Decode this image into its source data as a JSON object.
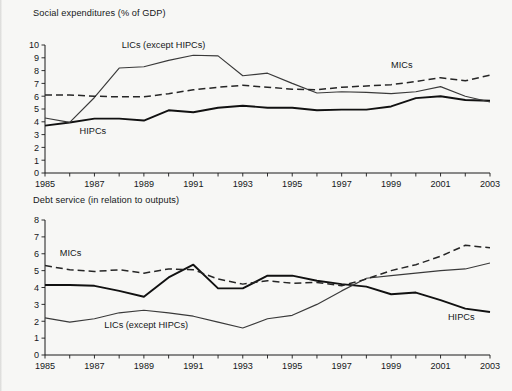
{
  "page": {
    "background_color": "#f7f7f5",
    "ink_color": "#16181a"
  },
  "figures": [
    {
      "id": "social",
      "title": "Social expenditures (% of GDP)"
    },
    {
      "id": "debt",
      "title": "Debt service (in relation to outputs)"
    }
  ],
  "chart_data": [
    {
      "type": "line",
      "title": "Social expenditures (% of GDP)",
      "xlabel": "",
      "ylabel": "",
      "grid": false,
      "legend": "inline-annotations",
      "xlim": [
        1985,
        2003
      ],
      "ylim": [
        0,
        10
      ],
      "ytick_labels": [
        "0",
        "1",
        "2",
        "3",
        "4",
        "5",
        "6",
        "7",
        "8",
        "9",
        "10"
      ],
      "xtick_labels": [
        "1985",
        "1987",
        "1989",
        "1991",
        "1993",
        "1995",
        "1997",
        "1999",
        "2001",
        "2003"
      ],
      "xticks_minor_every": 1,
      "x": [
        1985,
        1986,
        1987,
        1988,
        1989,
        1990,
        1991,
        1992,
        1993,
        1994,
        1995,
        1996,
        1997,
        1998,
        1999,
        2000,
        2001,
        2002,
        2003
      ],
      "series": [
        {
          "name": "HIPCs",
          "style": "solid-thick",
          "label": "HIPCs",
          "label_x": 1986.4,
          "label_y": 3.05,
          "values": [
            3.7,
            3.95,
            4.25,
            4.25,
            4.1,
            4.9,
            4.75,
            5.1,
            5.25,
            5.1,
            5.1,
            4.9,
            4.95,
            4.95,
            5.2,
            5.85,
            6.0,
            5.7,
            5.65
          ]
        },
        {
          "name": "LICs (except HIPCs)",
          "style": "solid-thin",
          "label": "LICs (except HIPCs)",
          "label_x": 1988.1,
          "label_y": 9.75,
          "values": [
            4.3,
            3.95,
            5.9,
            8.2,
            8.3,
            8.8,
            9.2,
            9.15,
            7.6,
            7.8,
            7.0,
            6.25,
            6.35,
            6.3,
            6.2,
            6.35,
            6.75,
            6.0,
            5.55
          ]
        },
        {
          "name": "MICs",
          "style": "dashed",
          "label": "MICs",
          "label_x": 1999.0,
          "label_y": 8.2,
          "values": [
            6.1,
            6.1,
            6.0,
            5.95,
            5.95,
            6.2,
            6.5,
            6.7,
            6.85,
            6.7,
            6.55,
            6.5,
            6.7,
            6.8,
            6.9,
            7.15,
            7.45,
            7.2,
            7.65
          ]
        }
      ]
    },
    {
      "type": "line",
      "title": "Debt service (in relation to outputs)",
      "xlabel": "",
      "ylabel": "",
      "grid": false,
      "legend": "inline-annotations",
      "xlim": [
        1985,
        2003
      ],
      "ylim": [
        0,
        8
      ],
      "ytick_labels": [
        "0",
        "1",
        "2",
        "3",
        "4",
        "5",
        "6",
        "7",
        "8"
      ],
      "xtick_labels": [
        "1985",
        "1987",
        "1989",
        "1991",
        "1993",
        "1995",
        "1997",
        "1999",
        "2001",
        "2003"
      ],
      "xticks_minor_every": 1,
      "x": [
        1985,
        1986,
        1987,
        1988,
        1989,
        1990,
        1991,
        1992,
        1993,
        1994,
        1995,
        1996,
        1997,
        1998,
        1999,
        2000,
        2001,
        2002,
        2003
      ],
      "series": [
        {
          "name": "HIPCs",
          "style": "solid-thick",
          "label": "HIPCs",
          "label_x": 2001.3,
          "label_y": 2.05,
          "values": [
            4.15,
            4.15,
            4.1,
            3.8,
            3.45,
            4.6,
            5.35,
            3.95,
            3.95,
            4.7,
            4.7,
            4.4,
            4.2,
            4.05,
            3.6,
            3.7,
            3.25,
            2.75,
            2.55
          ]
        },
        {
          "name": "LICs (except HIPCs)",
          "style": "solid-thin",
          "label": "LICs (except HIPCs)",
          "label_x": 1987.4,
          "label_y": 1.62,
          "values": [
            2.2,
            1.95,
            2.15,
            2.5,
            2.65,
            2.5,
            2.3,
            1.95,
            1.6,
            2.15,
            2.35,
            3.0,
            3.8,
            4.55,
            4.7,
            4.85,
            5.0,
            5.1,
            5.45
          ]
        },
        {
          "name": "MICs",
          "style": "dashed",
          "label": "MICs",
          "label_x": 1985.6,
          "label_y": 5.85,
          "values": [
            5.3,
            5.05,
            4.95,
            5.05,
            4.85,
            5.1,
            5.05,
            4.5,
            4.2,
            4.4,
            4.25,
            4.3,
            4.1,
            4.5,
            5.0,
            5.35,
            5.85,
            6.5,
            6.35
          ]
        }
      ]
    }
  ]
}
